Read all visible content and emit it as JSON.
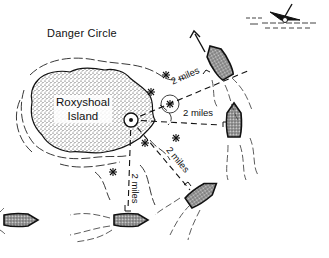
{
  "diagram": {
    "title": "Danger Circle",
    "island": {
      "name_line1": "Roxyshoal",
      "name_line2": "Island"
    },
    "distance_labels": [
      {
        "id": "upper-right",
        "text": "2 miles"
      },
      {
        "id": "right",
        "text": "2 miles"
      },
      {
        "id": "lower-right",
        "text": "2 miles"
      },
      {
        "id": "down",
        "text": "2 miles"
      }
    ],
    "elements": {
      "center_marker": "lighthouse-position-icon",
      "hazards": "rock-hazard-icons",
      "boats": 5,
      "wreck": "sinking-boat-icon",
      "direction_arrow": "arrow-up-left"
    },
    "colors": {
      "ink": "#111111",
      "background": "#ffffff"
    }
  }
}
